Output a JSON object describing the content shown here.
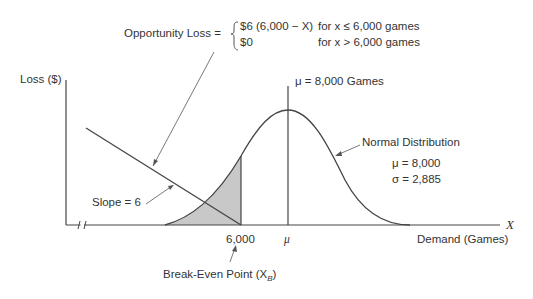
{
  "formula": {
    "label": "Opportunity Loss =",
    "case1_expr": "$6 (6,000 − X)",
    "case1_cond": "for x ≤ 6,000 games",
    "case2_expr": "$0",
    "case2_cond": "for x > 6,000 games"
  },
  "axes": {
    "y_label": "Loss ($)",
    "x_symbol": "X",
    "x_label": "Demand (Games)",
    "tick_6000": "6,000",
    "tick_mu": "μ"
  },
  "annotations": {
    "mean_line": "μ = 8,000 Games",
    "normal_dist": "Normal Distribution",
    "mu_value": "μ = 8,000",
    "sigma_value": "σ = 2,885",
    "slope": "Slope = 6",
    "break_even": "Break-Even Point (X",
    "break_even_sub": "B",
    "break_even_close": ")"
  },
  "colors": {
    "line": "#444444",
    "shade": "#c8c8c8"
  }
}
